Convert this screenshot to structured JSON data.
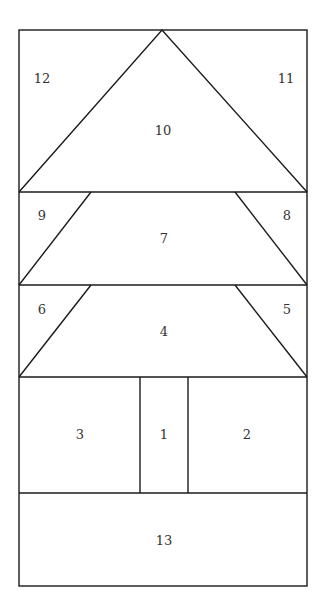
{
  "diagram": {
    "title": "",
    "type": "quilt-block-piecing-diagram",
    "line_color": "#1a1a1a",
    "background": "#ffffff",
    "pieces": [
      {
        "id": "1",
        "label": "1",
        "shape": "rectangle",
        "x": 164,
        "y": 435
      },
      {
        "id": "2",
        "label": "2",
        "shape": "rectangle",
        "x": 247,
        "y": 435
      },
      {
        "id": "3",
        "label": "3",
        "shape": "rectangle",
        "x": 80,
        "y": 435
      },
      {
        "id": "4",
        "label": "4",
        "shape": "trapezoid",
        "x": 164,
        "y": 332
      },
      {
        "id": "5",
        "label": "5",
        "shape": "triangle",
        "x": 287,
        "y": 310
      },
      {
        "id": "6",
        "label": "6",
        "shape": "triangle",
        "x": 42,
        "y": 310
      },
      {
        "id": "7",
        "label": "7",
        "shape": "trapezoid",
        "x": 164,
        "y": 239
      },
      {
        "id": "8",
        "label": "8",
        "shape": "triangle",
        "x": 287,
        "y": 216
      },
      {
        "id": "9",
        "label": "9",
        "shape": "triangle",
        "x": 42,
        "y": 216
      },
      {
        "id": "10",
        "label": "10",
        "shape": "triangle",
        "x": 163,
        "y": 131
      },
      {
        "id": "11",
        "label": "11",
        "shape": "triangle",
        "x": 286,
        "y": 79
      },
      {
        "id": "12",
        "label": "12",
        "shape": "triangle",
        "x": 42,
        "y": 79
      },
      {
        "id": "13",
        "label": "13",
        "shape": "rectangle",
        "x": 164,
        "y": 541
      }
    ]
  }
}
